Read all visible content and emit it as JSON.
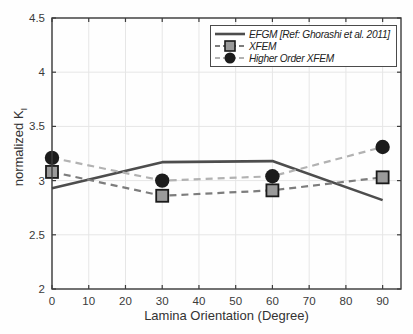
{
  "figure": {
    "background": "#ffffff"
  },
  "chart_data": {
    "type": "line",
    "title": "",
    "xlabel": "Lamina Orientation (Degree)",
    "ylabel": "normalized K",
    "ylabel_subscript": "I",
    "xlim": [
      0,
      95
    ],
    "ylim": [
      2,
      4.5
    ],
    "x_ticks": [
      0,
      10,
      20,
      30,
      40,
      50,
      60,
      70,
      80,
      90
    ],
    "y_ticks": [
      2,
      2.5,
      3,
      3.5,
      4,
      4.5
    ],
    "grid": true,
    "legend_position": "top-right",
    "x": [
      0,
      30,
      60,
      90
    ],
    "series": [
      {
        "name": "EFGM [Ref: Ghorashi et al. 2011]",
        "values": [
          2.93,
          3.17,
          3.18,
          2.82
        ],
        "line_style": "solid",
        "marker": "none",
        "color": "#4d4d4d",
        "line_width": 2.6
      },
      {
        "name": "XFEM",
        "values": [
          3.08,
          2.86,
          2.91,
          3.03
        ],
        "line_style": "dashed",
        "marker": "square",
        "color": "#7d7d7d",
        "marker_fill": "#9a9a9a",
        "marker_edge": "#1a1a1a",
        "line_width": 2.2
      },
      {
        "name": "Higher Order XFEM",
        "values": [
          3.21,
          3.0,
          3.04,
          3.31
        ],
        "line_style": "dashed",
        "marker": "circle",
        "color": "#b2b2b2",
        "marker_fill": "#1c1c1c",
        "marker_edge": "#1c1c1c",
        "line_width": 2.2
      }
    ],
    "axis_color": "#3c3c3c",
    "grid_color": "#e6e6e6",
    "tick_label_color": "#3a3a3a"
  }
}
